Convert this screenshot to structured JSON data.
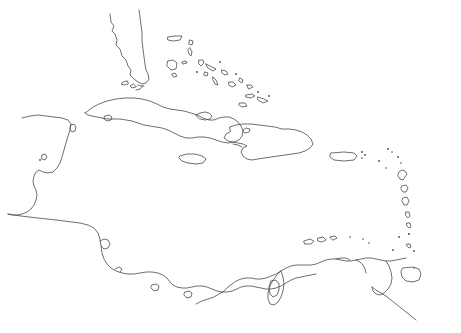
{
  "document": {
    "kind": "outline-map",
    "title": "Caribbean Region Outline Map",
    "region": "Caribbean Sea, Gulf of Mexico and adjacent coasts",
    "width": 461,
    "height": 333,
    "background_color": "#ffffff",
    "line_color": "#4a4a4a",
    "line_width": 0.8,
    "has_labels": false,
    "has_border": false,
    "has_graticule": false,
    "fill_style": "none"
  },
  "landmasses": [
    {
      "name": "florida-peninsula",
      "type": "mainland-peninsula"
    },
    {
      "name": "florida-keys",
      "type": "island-chain"
    },
    {
      "name": "yucatan-peninsula",
      "type": "mainland-peninsula"
    },
    {
      "name": "central-america-isthmus",
      "type": "mainland"
    },
    {
      "name": "cuba",
      "type": "island"
    },
    {
      "name": "isla-de-la-juventud",
      "type": "island"
    },
    {
      "name": "hispaniola",
      "type": "island"
    },
    {
      "name": "jamaica",
      "type": "island"
    },
    {
      "name": "puerto-rico",
      "type": "island"
    },
    {
      "name": "bahamas",
      "type": "archipelago"
    },
    {
      "name": "turks-and-caicos",
      "type": "archipelago"
    },
    {
      "name": "virgin-islands",
      "type": "archipelago"
    },
    {
      "name": "leeward-islands",
      "type": "island-chain"
    },
    {
      "name": "windward-islands",
      "type": "island-chain"
    },
    {
      "name": "trinidad",
      "type": "island"
    },
    {
      "name": "abc-islands",
      "type": "island-chain"
    },
    {
      "name": "south-america-north-coast",
      "type": "mainland"
    },
    {
      "name": "lake-maracaibo",
      "type": "inland-water"
    }
  ]
}
